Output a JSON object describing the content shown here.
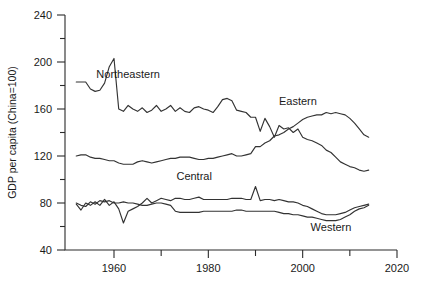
{
  "chart_data": {
    "type": "line",
    "title": "",
    "xlabel": "",
    "ylabel": "GDP per capita (China=100)",
    "xlim": [
      1952,
      2020
    ],
    "ylim": [
      40,
      240
    ],
    "xticks": [
      1960,
      1980,
      2000,
      2020
    ],
    "xticks_minor": [
      1970,
      1990,
      2010
    ],
    "yticks": [
      40,
      80,
      120,
      160,
      200,
      240
    ],
    "yticks_minor": [
      60,
      100,
      140,
      180,
      220
    ],
    "grid": false,
    "legend": "inline-annotations",
    "annotations": [
      {
        "text": "Northeastern",
        "x": 1963,
        "y": 186
      },
      {
        "text": "Eastern",
        "x": 1999,
        "y": 163
      },
      {
        "text": "Central",
        "x": 1977,
        "y": 100
      },
      {
        "text": "Western",
        "x": 2006,
        "y": 56
      }
    ],
    "series": [
      {
        "name": "Northeastern",
        "x": [
          1952,
          1953,
          1954,
          1955,
          1956,
          1957,
          1958,
          1959,
          1960,
          1961,
          1962,
          1963,
          1964,
          1965,
          1966,
          1967,
          1968,
          1969,
          1970,
          1971,
          1972,
          1973,
          1974,
          1975,
          1976,
          1977,
          1978,
          1979,
          1980,
          1981,
          1982,
          1983,
          1984,
          1985,
          1986,
          1987,
          1988,
          1989,
          1990,
          1991,
          1992,
          1993,
          1994,
          1995,
          1996,
          1997,
          1998,
          1999,
          2000,
          2001,
          2002,
          2003,
          2004,
          2005,
          2006,
          2007,
          2008,
          2009,
          2010,
          2011,
          2012,
          2013,
          2014
        ],
        "y": [
          183,
          183,
          183,
          177,
          175,
          176,
          182,
          196,
          203,
          160,
          158,
          163,
          160,
          158,
          161,
          157,
          159,
          163,
          158,
          160,
          163,
          158,
          161,
          158,
          157,
          161,
          162,
          160,
          159,
          157,
          162,
          168,
          169,
          167,
          159,
          158,
          157,
          153,
          153,
          141,
          152,
          145,
          136,
          146,
          143,
          144,
          140,
          143,
          136,
          134,
          133,
          131,
          129,
          125,
          123,
          119,
          115,
          113,
          111,
          110,
          108,
          107,
          108
        ]
      },
      {
        "name": "Eastern",
        "x": [
          1952,
          1953,
          1954,
          1955,
          1956,
          1957,
          1958,
          1959,
          1960,
          1961,
          1962,
          1963,
          1964,
          1965,
          1966,
          1967,
          1968,
          1969,
          1970,
          1971,
          1972,
          1973,
          1974,
          1975,
          1976,
          1977,
          1978,
          1979,
          1980,
          1981,
          1982,
          1983,
          1984,
          1985,
          1986,
          1987,
          1988,
          1989,
          1990,
          1991,
          1992,
          1993,
          1994,
          1995,
          1996,
          1997,
          1998,
          1999,
          2000,
          2001,
          2002,
          2003,
          2004,
          2005,
          2006,
          2007,
          2008,
          2009,
          2010,
          2011,
          2012,
          2013,
          2014
        ],
        "y": [
          120,
          121,
          121,
          119,
          118,
          118,
          117,
          116,
          116,
          114,
          113,
          113,
          113,
          115,
          116,
          115,
          114,
          115,
          116,
          117,
          118,
          118,
          119,
          119,
          119,
          118,
          117,
          117,
          118,
          118,
          119,
          120,
          121,
          122,
          120,
          120,
          121,
          122,
          128,
          128,
          131,
          133,
          137,
          138,
          140,
          143,
          145,
          148,
          151,
          153,
          154,
          155,
          155,
          157,
          156,
          157,
          156,
          155,
          152,
          148,
          143,
          138,
          136
        ]
      },
      {
        "name": "Central",
        "x": [
          1952,
          1953,
          1954,
          1955,
          1956,
          1957,
          1958,
          1959,
          1960,
          1961,
          1962,
          1963,
          1964,
          1965,
          1966,
          1967,
          1968,
          1969,
          1970,
          1971,
          1972,
          1973,
          1974,
          1975,
          1976,
          1977,
          1978,
          1979,
          1980,
          1981,
          1982,
          1983,
          1984,
          1985,
          1986,
          1987,
          1988,
          1989,
          1990,
          1991,
          1992,
          1993,
          1994,
          1995,
          1996,
          1997,
          1998,
          1999,
          2000,
          2001,
          2002,
          2003,
          2004,
          2005,
          2006,
          2007,
          2008,
          2009,
          2010,
          2011,
          2012,
          2013,
          2014
        ],
        "y": [
          79,
          74,
          80,
          78,
          81,
          78,
          83,
          78,
          81,
          75,
          63,
          73,
          75,
          77,
          80,
          84,
          80,
          82,
          84,
          83,
          82,
          84,
          84,
          83,
          83,
          84,
          85,
          83,
          83,
          83,
          83,
          83,
          83,
          84,
          84,
          84,
          83,
          83,
          94,
          82,
          83,
          83,
          82,
          83,
          82,
          81,
          81,
          80,
          78,
          77,
          75,
          73,
          71,
          70,
          70,
          70,
          71,
          72,
          74,
          76,
          77,
          78,
          79
        ]
      },
      {
        "name": "Western",
        "x": [
          1952,
          1953,
          1954,
          1955,
          1956,
          1957,
          1958,
          1959,
          1960,
          1961,
          1962,
          1963,
          1964,
          1965,
          1966,
          1967,
          1968,
          1969,
          1970,
          1971,
          1972,
          1973,
          1974,
          1975,
          1976,
          1977,
          1978,
          1979,
          1980,
          1981,
          1982,
          1983,
          1984,
          1985,
          1986,
          1987,
          1988,
          1989,
          1990,
          1991,
          1992,
          1993,
          1994,
          1995,
          1996,
          1997,
          1998,
          1999,
          2000,
          2001,
          2002,
          2003,
          2004,
          2005,
          2006,
          2007,
          2008,
          2009,
          2010,
          2011,
          2012,
          2013,
          2014
        ],
        "y": [
          80,
          78,
          77,
          81,
          79,
          82,
          81,
          82,
          80,
          80,
          81,
          80,
          80,
          79,
          78,
          78,
          79,
          80,
          80,
          79,
          78,
          73,
          72,
          72,
          72,
          72,
          72,
          73,
          73,
          73,
          73,
          73,
          73,
          73,
          74,
          74,
          73,
          73,
          73,
          73,
          73,
          73,
          73,
          72,
          71,
          71,
          70,
          70,
          69,
          68,
          68,
          67,
          66,
          65,
          65,
          65,
          66,
          68,
          70,
          73,
          75,
          76,
          78
        ]
      }
    ]
  }
}
